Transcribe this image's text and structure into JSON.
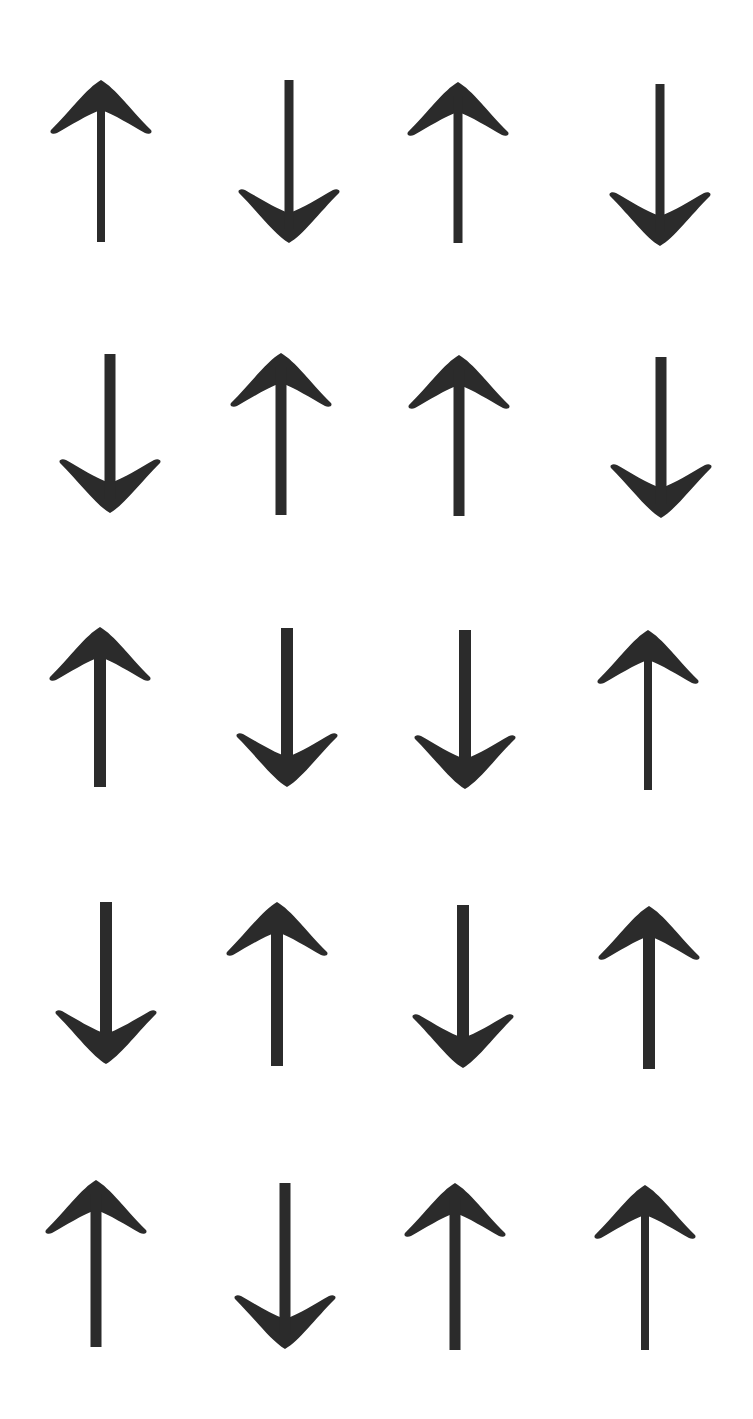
{
  "canvas": {
    "width": 753,
    "height": 1419,
    "background": "#ffffff"
  },
  "arrow_color": "#2b2b2b",
  "grid": {
    "rows": 5,
    "cols": 4,
    "arrows": [
      {
        "row": 1,
        "col": 1,
        "dir": "up",
        "cx": 101,
        "top": 80,
        "bottom": 242,
        "shaft": 8
      },
      {
        "row": 1,
        "col": 2,
        "dir": "down",
        "cx": 289,
        "top": 80,
        "bottom": 243,
        "shaft": 9
      },
      {
        "row": 1,
        "col": 3,
        "dir": "up",
        "cx": 458,
        "top": 82,
        "bottom": 243,
        "shaft": 9
      },
      {
        "row": 1,
        "col": 4,
        "dir": "down",
        "cx": 660,
        "top": 84,
        "bottom": 246,
        "shaft": 9
      },
      {
        "row": 2,
        "col": 1,
        "dir": "down",
        "cx": 110,
        "top": 354,
        "bottom": 513,
        "shaft": 11
      },
      {
        "row": 2,
        "col": 2,
        "dir": "up",
        "cx": 281,
        "top": 353,
        "bottom": 515,
        "shaft": 11
      },
      {
        "row": 2,
        "col": 3,
        "dir": "up",
        "cx": 459,
        "top": 355,
        "bottom": 516,
        "shaft": 11
      },
      {
        "row": 2,
        "col": 4,
        "dir": "down",
        "cx": 661,
        "top": 357,
        "bottom": 518,
        "shaft": 11
      },
      {
        "row": 3,
        "col": 1,
        "dir": "up",
        "cx": 100,
        "top": 627,
        "bottom": 787,
        "shaft": 12
      },
      {
        "row": 3,
        "col": 2,
        "dir": "down",
        "cx": 287,
        "top": 628,
        "bottom": 787,
        "shaft": 12
      },
      {
        "row": 3,
        "col": 3,
        "dir": "down",
        "cx": 465,
        "top": 630,
        "bottom": 789,
        "shaft": 12
      },
      {
        "row": 3,
        "col": 4,
        "dir": "up",
        "cx": 648,
        "top": 630,
        "bottom": 790,
        "shaft": 8
      },
      {
        "row": 4,
        "col": 1,
        "dir": "down",
        "cx": 106,
        "top": 902,
        "bottom": 1064,
        "shaft": 12
      },
      {
        "row": 4,
        "col": 2,
        "dir": "up",
        "cx": 277,
        "top": 902,
        "bottom": 1066,
        "shaft": 12
      },
      {
        "row": 4,
        "col": 3,
        "dir": "down",
        "cx": 463,
        "top": 905,
        "bottom": 1068,
        "shaft": 12
      },
      {
        "row": 4,
        "col": 4,
        "dir": "up",
        "cx": 649,
        "top": 906,
        "bottom": 1069,
        "shaft": 12
      },
      {
        "row": 5,
        "col": 1,
        "dir": "up",
        "cx": 96,
        "top": 1180,
        "bottom": 1347,
        "shaft": 11
      },
      {
        "row": 5,
        "col": 2,
        "dir": "down",
        "cx": 285,
        "top": 1183,
        "bottom": 1349,
        "shaft": 11
      },
      {
        "row": 5,
        "col": 3,
        "dir": "up",
        "cx": 455,
        "top": 1183,
        "bottom": 1350,
        "shaft": 11
      },
      {
        "row": 5,
        "col": 4,
        "dir": "up",
        "cx": 645,
        "top": 1185,
        "bottom": 1350,
        "shaft": 8
      }
    ]
  }
}
